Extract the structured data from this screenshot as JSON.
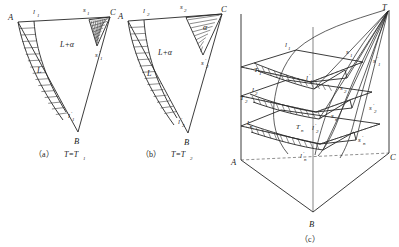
{
  "figure": {
    "kind": "ternary-phase-diagram",
    "panels": [
      "a",
      "b",
      "c"
    ]
  },
  "panel_a": {
    "caption_index": "（a）",
    "caption_text": "T=T",
    "caption_sub": "1",
    "vertices": {
      "A": "A",
      "B": "B",
      "C": "C"
    },
    "points": {
      "l": "l",
      "l_sub": "1",
      "s": "s",
      "s_sub": "1",
      "l_prime": "l",
      "l_prime_mark": "′",
      "l_prime_sub": "1",
      "s_prime": "s",
      "s_prime_mark": "′",
      "s_prime_sub": "1"
    },
    "regions": {
      "two_phase": "L+α",
      "liquid": "L"
    }
  },
  "panel_b": {
    "caption_index": "（b）",
    "caption_text": "T=T",
    "caption_sub": "2",
    "vertices": {
      "A": "A",
      "B": "B",
      "C": "C"
    },
    "points": {
      "l": "l",
      "l_sub": "2",
      "s": "s",
      "s_sub": "2",
      "l_prime": "l",
      "l_prime_mark": "′",
      "l_prime_sub": "2",
      "s_prime": "s",
      "s_prime_mark": "′",
      "s_prime_sub": "2"
    },
    "regions": {
      "two_phase": "L+α",
      "liquid": "L",
      "alpha": "α"
    }
  },
  "panel_c": {
    "caption_index": "（c）",
    "vertices": {
      "A": "A",
      "B": "B",
      "C": "C",
      "T": "T"
    },
    "isotherms": [
      {
        "temp": "T",
        "temp_sub": "1",
        "liquidus": "l",
        "liquidus_sub": "1",
        "liquidus_prime": "l",
        "liquidus_prime_mark": "′",
        "liquidus_prime_sub": "1",
        "solidus": "s",
        "solidus_sub": "1",
        "solidus_prime": "s",
        "solidus_prime_mark": "′",
        "solidus_prime_sub": "1"
      },
      {
        "temp": "T",
        "temp_sub": "2",
        "liquidus": "l",
        "liquidus_sub": "2",
        "liquidus_prime": "l",
        "liquidus_prime_mark": "′",
        "liquidus_prime_sub": "2",
        "solidus": "s",
        "solidus_sub": "2",
        "solidus_prime": "s",
        "solidus_prime_mark": "′",
        "solidus_prime_sub": "2"
      },
      {
        "temp": "T",
        "temp_sub": "n",
        "liquidus": "l",
        "liquidus_sub": "n",
        "liquidus_prime": "l",
        "liquidus_prime_mark": "′",
        "liquidus_prime_sub": "n",
        "solidus": "s",
        "solidus_sub": "n",
        "solidus_prime": "s",
        "solidus_prime_mark": "′",
        "solidus_prime_sub": "n"
      }
    ]
  },
  "colors": {
    "ink": "#262626",
    "hatch": "#303030",
    "dashed": "#444444",
    "background": "#ffffff"
  }
}
